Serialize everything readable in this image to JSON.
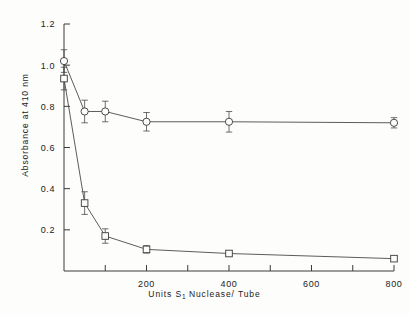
{
  "figure": {
    "background": "#fdfdfc",
    "ink": "#3a3a3a"
  },
  "axes": {
    "ylabel": "Absorbance at 410 nm",
    "xlabel_prefix": "Units  S",
    "xlabel_sub": "1",
    "xlabel_suffix": "  Nuclease/ Tube",
    "y_ticklabels": [
      "0.2",
      "0.4",
      "0.6",
      "0.8",
      "1.0",
      "1.2"
    ],
    "x_ticklabels": [
      "200",
      "400",
      "600",
      "800"
    ]
  },
  "chart_data": {
    "type": "line",
    "title": "",
    "xlabel": "Units S1 Nuclease/Tube",
    "ylabel": "Absorbance at 410 nm",
    "xlim": [
      0,
      800
    ],
    "ylim": [
      0.0,
      1.2
    ],
    "yticks": [
      0.2,
      0.4,
      0.6,
      0.8,
      1.0,
      1.2
    ],
    "xticks": [
      0,
      100,
      200,
      300,
      400,
      500,
      600,
      700,
      800
    ],
    "xticklabels_shown": [
      200,
      400,
      600,
      800
    ],
    "grid": false,
    "legend": "none",
    "error_bars": "symmetric",
    "series": [
      {
        "name": "open-circle-series",
        "marker": "circle",
        "x": [
          0,
          50,
          100,
          200,
          400,
          800
        ],
        "y": [
          1.02,
          0.775,
          0.775,
          0.725,
          0.725,
          0.72
        ],
        "yerr": [
          0.055,
          0.055,
          0.05,
          0.045,
          0.05,
          0.025
        ]
      },
      {
        "name": "open-square-series",
        "marker": "square",
        "x": [
          0,
          50,
          100,
          200,
          400,
          800
        ],
        "y": [
          0.935,
          0.33,
          0.17,
          0.105,
          0.085,
          0.06
        ],
        "yerr": [
          0.055,
          0.055,
          0.035,
          0.018,
          0.012,
          0.012
        ]
      }
    ]
  }
}
